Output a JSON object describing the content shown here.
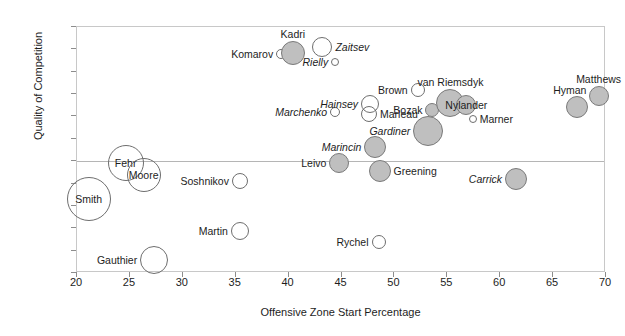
{
  "chart_data": {
    "type": "scatter",
    "title": "",
    "xlabel": "Offensive Zone Start Percentage",
    "ylabel": "Quality of Competition",
    "xlim": [
      20,
      70
    ],
    "ylim": [
      -2.5,
      3.0
    ],
    "xticks": [
      "20",
      "25",
      "30",
      "35",
      "40",
      "45",
      "50",
      "55",
      "60",
      "65",
      "70"
    ],
    "yticks": [
      "3.0",
      "2.5",
      "2.0",
      "1.5",
      "1.0",
      "0.5",
      "0.0",
      "-0.5",
      "-1.0",
      "-1.5",
      "-2.0",
      "-2.5"
    ],
    "grid": false,
    "legend": "none",
    "marker_shape": "circle",
    "size_encoding": "bubble-size",
    "colors": {
      "bubble_fill": "#bfbfbf",
      "bubble_stroke": "#6e6e6e",
      "frame": "#c8c8c8",
      "zero_line": "#b5b5b5",
      "text": "#1d1d1d"
    },
    "points": [
      {
        "name": "Smith",
        "x": 21.1,
        "y": -0.85,
        "r": 22,
        "fill": "open",
        "italic": false,
        "label_pos": "center"
      },
      {
        "name": "Fehr",
        "x": 24.6,
        "y": -0.05,
        "r": 18,
        "fill": "open",
        "italic": false,
        "label_pos": "center"
      },
      {
        "name": "Moore",
        "x": 26.3,
        "y": -0.3,
        "r": 17,
        "fill": "open",
        "italic": false,
        "label_pos": "center"
      },
      {
        "name": "Gauthier",
        "x": 27.3,
        "y": -2.2,
        "r": 14,
        "fill": "open",
        "italic": false,
        "label_pos": "left"
      },
      {
        "name": "Soshnikov",
        "x": 35.4,
        "y": -0.45,
        "r": 8,
        "fill": "open",
        "italic": false,
        "label_pos": "left"
      },
      {
        "name": "Martin",
        "x": 35.4,
        "y": -1.55,
        "r": 9,
        "fill": "open",
        "italic": false,
        "label_pos": "left"
      },
      {
        "name": "Komarov",
        "x": 39.3,
        "y": 2.4,
        "r": 5,
        "fill": "open",
        "italic": false,
        "label_pos": "left"
      },
      {
        "name": "Kadri",
        "x": 40.4,
        "y": 2.42,
        "r": 12,
        "fill": "filled",
        "italic": false,
        "label_pos": "above"
      },
      {
        "name": "Zaitsev",
        "x": 43.2,
        "y": 2.55,
        "r": 10,
        "fill": "open",
        "italic": true,
        "label_pos": "right"
      },
      {
        "name": "Rielly",
        "x": 44.4,
        "y": 2.22,
        "r": 4,
        "fill": "open",
        "italic": true,
        "label_pos": "left"
      },
      {
        "name": "Marchenko",
        "x": 44.4,
        "y": 1.1,
        "r": 5,
        "fill": "open",
        "italic": true,
        "label_pos": "left"
      },
      {
        "name": "Leivo",
        "x": 44.8,
        "y": -0.05,
        "r": 10,
        "fill": "filled",
        "italic": false,
        "label_pos": "left"
      },
      {
        "name": "Hainsey",
        "x": 47.7,
        "y": 1.28,
        "r": 9,
        "fill": "open",
        "italic": true,
        "label_pos": "left"
      },
      {
        "name": "Marleau",
        "x": 47.6,
        "y": 1.05,
        "r": 8,
        "fill": "open",
        "italic": false,
        "label_pos": "right"
      },
      {
        "name": "Marincin",
        "x": 48.2,
        "y": 0.32,
        "r": 11,
        "fill": "filled",
        "italic": true,
        "label_pos": "left"
      },
      {
        "name": "Greening",
        "x": 48.6,
        "y": -0.22,
        "r": 11,
        "fill": "filled",
        "italic": false,
        "label_pos": "right"
      },
      {
        "name": "Rychel",
        "x": 48.5,
        "y": -1.8,
        "r": 7,
        "fill": "open",
        "italic": false,
        "label_pos": "left"
      },
      {
        "name": "Brown",
        "x": 52.2,
        "y": 1.6,
        "r": 7,
        "fill": "open",
        "italic": false,
        "label_pos": "left"
      },
      {
        "name": "Bozak",
        "x": 53.6,
        "y": 1.15,
        "r": 7,
        "fill": "filled",
        "italic": false,
        "label_pos": "left"
      },
      {
        "name": "Gardiner",
        "x": 53.2,
        "y": 0.68,
        "r": 15,
        "fill": "filled",
        "italic": true,
        "label_pos": "left"
      },
      {
        "name": "van Riemsdyk",
        "x": 55.3,
        "y": 1.3,
        "r": 14,
        "fill": "filled",
        "italic": false,
        "label_pos": "above"
      },
      {
        "name": "Nylander",
        "x": 56.8,
        "y": 1.25,
        "r": 10,
        "fill": "filled",
        "italic": false,
        "label_pos": "center"
      },
      {
        "name": "Marner",
        "x": 57.4,
        "y": 0.95,
        "r": 4,
        "fill": "open",
        "italic": false,
        "label_pos": "right"
      },
      {
        "name": "Carrick",
        "x": 61.5,
        "y": -0.4,
        "r": 11,
        "fill": "filled",
        "italic": true,
        "label_pos": "left"
      },
      {
        "name": "Hyman",
        "x": 67.3,
        "y": 1.22,
        "r": 11,
        "fill": "filled",
        "italic": false,
        "label_pos": "above-left"
      },
      {
        "name": "Matthews",
        "x": 69.3,
        "y": 1.45,
        "r": 10,
        "fill": "filled",
        "italic": false,
        "label_pos": "above"
      }
    ]
  }
}
